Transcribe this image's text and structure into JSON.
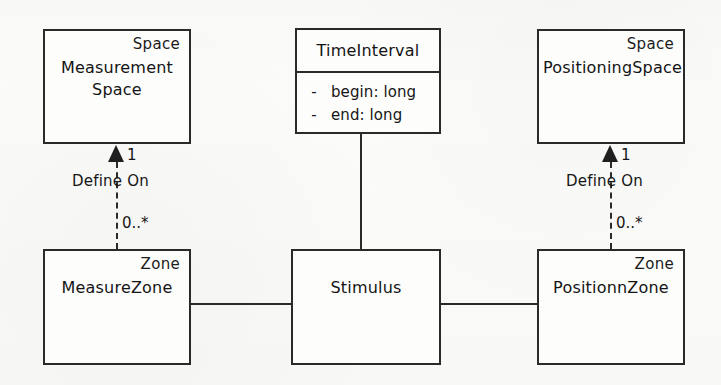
{
  "diagram": {
    "background_color": "#fbfbf9",
    "stroke_color": "#2a2a2a",
    "text_color": "#141414"
  },
  "classes": {
    "measurement_space": {
      "stereotype": "Space",
      "name": "Measurement\nSpace"
    },
    "time_interval": {
      "name": "TimeInterval",
      "attributes": [
        {
          "visibility": "-",
          "text": "begin: long"
        },
        {
          "visibility": "-",
          "text": "end: long"
        }
      ]
    },
    "positioning_space": {
      "stereotype": "Space",
      "name": "PositioningSpace"
    },
    "measure_zone": {
      "stereotype": "Zone",
      "name": "MeasureZone"
    },
    "stimulus": {
      "name": "Stimulus"
    },
    "positionn_zone": {
      "stereotype": "Zone",
      "name": "PositionnZone"
    }
  },
  "relationships": {
    "left_define_on": {
      "label": "Define On",
      "source_multiplicity": "0..*",
      "target_multiplicity": "1"
    },
    "right_define_on": {
      "label": "Define On",
      "source_multiplicity": "0..*",
      "target_multiplicity": "1"
    }
  }
}
